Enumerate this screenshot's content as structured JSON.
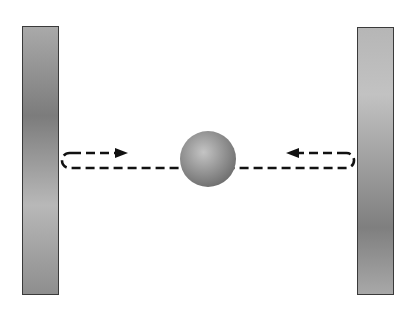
{
  "diagram": {
    "background": "#ffffff",
    "walls": [
      {
        "id": "left",
        "x": 22,
        "y": 26,
        "width": 37,
        "height": 269,
        "gradient": [
          "#a9a9a9",
          "#7c7c7c",
          "#b8b8b8",
          "#8e8e8e"
        ]
      },
      {
        "id": "right",
        "x": 357,
        "y": 27,
        "width": 37,
        "height": 268,
        "gradient": [
          "#b6b6b6",
          "#c2c2c2",
          "#a0a0a0",
          "#7f7f7f",
          "#a8a8a8"
        ]
      }
    ],
    "ball": {
      "cx": 208,
      "cy": 159,
      "r": 28,
      "highlight": "#c4c4c4",
      "shadow": "#6e6e6e"
    },
    "path": {
      "stroke": "#111111",
      "dash": "9,5",
      "upper_y": 153,
      "lower_y": 168,
      "left_x": 62,
      "right_x": 354
    },
    "arrows": [
      {
        "direction": "right",
        "from_x": 72,
        "to_x": 128,
        "y": 153
      },
      {
        "direction": "left",
        "from_x": 346,
        "to_x": 286,
        "y": 153
      }
    ]
  }
}
